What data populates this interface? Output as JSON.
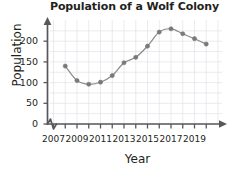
{
  "chart_data": {
    "type": "scatter",
    "title": "Population of a Wolf Colony",
    "xlabel": "Year",
    "ylabel": "Population",
    "x": [
      2008,
      2009,
      2010,
      2011,
      2012,
      2013,
      2014,
      2015,
      2016,
      2017,
      2018,
      2019,
      2020
    ],
    "values": [
      140,
      105,
      96,
      101,
      117,
      148,
      161,
      188,
      222,
      230,
      218,
      206,
      193
    ],
    "series": [
      {
        "name": "Wolf population",
        "values": [
          140,
          105,
          96,
          101,
          117,
          148,
          161,
          188,
          222,
          230,
          218,
          206,
          193
        ]
      }
    ],
    "xlim": [
      2006.5,
      2021
    ],
    "ylim": [
      0,
      240
    ],
    "xticks": [
      2007,
      2009,
      2011,
      2013,
      2015,
      2017,
      2019
    ],
    "xtick_labels": [
      "2007",
      "2009",
      "2011",
      "2013",
      "2015",
      "2017",
      "2019"
    ],
    "yticks": [
      0,
      50,
      100,
      150,
      200
    ],
    "ytick_labels": [
      "0",
      "50",
      "100",
      "150",
      "200"
    ],
    "grid": true,
    "legend": "none",
    "axis_break_y": true,
    "trend_line": true,
    "marker_color": "#7a7a7a",
    "line_color": "#8a8a8a",
    "grid_color": "#dcdde3",
    "axis_color": "#58585b",
    "text_color": "#231f20"
  }
}
